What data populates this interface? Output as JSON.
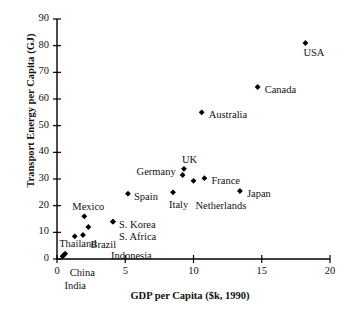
{
  "chart_data": {
    "type": "scatter",
    "title": "",
    "xlabel": "GDP per Capita ($k, 1990)",
    "ylabel": "Transport Energy per Capita (GJ)",
    "xlim": [
      0,
      20
    ],
    "ylim": [
      0,
      90
    ],
    "xticks": [
      0,
      5,
      10,
      15,
      20
    ],
    "yticks": [
      0,
      10,
      20,
      30,
      40,
      50,
      60,
      70,
      80,
      90
    ],
    "grid": false,
    "legend": "none",
    "marker": "diamond",
    "marker_color": "#000000",
    "points": [
      {
        "label": "USA",
        "x": 18.2,
        "y": 81.0,
        "label_dx": -2,
        "label_dy": 11
      },
      {
        "label": "Canada",
        "x": 14.7,
        "y": 64.5,
        "label_dx": 7,
        "label_dy": 4
      },
      {
        "label": "Australia",
        "x": 10.6,
        "y": 55.0,
        "label_dx": 7,
        "label_dy": 4
      },
      {
        "label": "UK",
        "x": 9.3,
        "y": 33.8,
        "label_dx": -2,
        "label_dy": -8
      },
      {
        "label": "Germany",
        "x": 9.2,
        "y": 31.5,
        "label_dx": -46,
        "label_dy": -2
      },
      {
        "label": "Netherlands",
        "x": 10.0,
        "y": 29.3,
        "label_dx": 2,
        "label_dy": 26
      },
      {
        "label": "France",
        "x": 10.8,
        "y": 30.3,
        "label_dx": 7,
        "label_dy": 4
      },
      {
        "label": "Japan",
        "x": 13.4,
        "y": 25.5,
        "label_dx": 7,
        "label_dy": 4
      },
      {
        "label": "Italy",
        "x": 8.5,
        "y": 25.0,
        "label_dx": -4,
        "label_dy": 14
      },
      {
        "label": "Spain",
        "x": 5.2,
        "y": 24.5,
        "label_dx": 6,
        "label_dy": 4
      },
      {
        "label": "Mexico",
        "x": 2.0,
        "y": 16.0,
        "label_dx": -12,
        "label_dy": -8
      },
      {
        "label": "S. Korea",
        "x": 4.1,
        "y": 14.0,
        "label_dx": 6,
        "label_dy": 4
      },
      {
        "label": "S. Africa",
        "x": 4.1,
        "y": 14.0,
        "label_dx": 6,
        "label_dy": 16
      },
      {
        "label": "Brazil",
        "x": 2.3,
        "y": 12.0,
        "label_dx": 2,
        "label_dy": 19
      },
      {
        "label": "Indonesia",
        "x": 1.9,
        "y": 9.0,
        "label_dx": 28,
        "label_dy": 22
      },
      {
        "label": "",
        "x": 1.3,
        "y": 8.5,
        "label_dx": 0,
        "label_dy": 0
      },
      {
        "label": "Thailand",
        "x": 0.6,
        "y": 2.0,
        "label_dx": -6,
        "label_dy": -9
      },
      {
        "label": "China",
        "x": 0.5,
        "y": 1.5,
        "label_dx": 6,
        "label_dy": 19
      },
      {
        "label": "India",
        "x": 0.4,
        "y": 1.0,
        "label_dx": 2,
        "label_dy": 31
      }
    ]
  },
  "axes": {
    "x_tick_labels": [
      "0",
      "5",
      "10",
      "15",
      "20"
    ],
    "y_tick_labels": [
      "0",
      "10",
      "20",
      "30",
      "40",
      "50",
      "60",
      "70",
      "80",
      "90"
    ],
    "x_title": "GDP per Capita ($k, 1990)",
    "y_title": "Transport Energy per Capita (GJ)"
  }
}
